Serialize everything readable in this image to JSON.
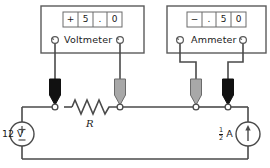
{
  "diagram": {
    "colors": {
      "wire": "#4a4a4a",
      "outline": "#5a5a5a",
      "probe_black": "#111111",
      "probe_gray": "#a8a8a8",
      "node_fill": "#ffffff",
      "text": "#1a1a1a"
    }
  },
  "instruments": [
    {
      "id": "voltmeter",
      "label": "Voltmeter",
      "reading": "+5.0",
      "display_cells": [
        "+",
        "5",
        ".",
        "0"
      ],
      "terminals": [
        "left-jack",
        "right-jack"
      ]
    },
    {
      "id": "ammeter",
      "label": "Ammeter",
      "reading": "-.50",
      "display_cells": [
        "−",
        ".",
        "5",
        "0"
      ],
      "terminals": [
        "left-jack",
        "right-jack"
      ]
    }
  ],
  "probes": [
    {
      "id": "probe-1",
      "color": "black",
      "connects_to": "voltmeter-left"
    },
    {
      "id": "probe-2",
      "color": "gray",
      "connects_to": "voltmeter-right"
    },
    {
      "id": "probe-3",
      "color": "gray",
      "connects_to": "ammeter-left"
    },
    {
      "id": "probe-4",
      "color": "black",
      "connects_to": "ammeter-right"
    }
  ],
  "components": [
    {
      "id": "voltage-source",
      "type": "independent-voltage-source",
      "value": "12 V",
      "plus_sign": "+",
      "minus_sign": "−"
    },
    {
      "id": "resistor",
      "type": "resistor",
      "label": "R"
    },
    {
      "id": "current-source",
      "type": "independent-current-source",
      "value_numerator": "1",
      "value_denominator": "2",
      "value_unit": "A",
      "arrow_direction": "up"
    }
  ],
  "nodes": [
    "node-a",
    "node-b",
    "node-c",
    "node-d"
  ]
}
